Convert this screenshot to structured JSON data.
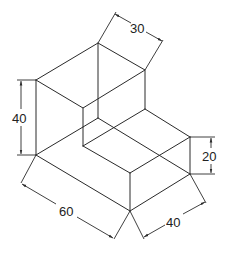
{
  "diagram": {
    "type": "isometric-drawing",
    "line_color": "#2a2a2a",
    "dimensions": [
      {
        "id": "top-depth",
        "label": "30"
      },
      {
        "id": "height-tall",
        "label": "40"
      },
      {
        "id": "height-short",
        "label": "20"
      },
      {
        "id": "length",
        "label": "60"
      },
      {
        "id": "width",
        "label": "40"
      }
    ]
  }
}
